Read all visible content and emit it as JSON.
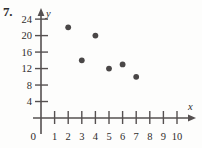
{
  "problem": {
    "number": "7."
  },
  "chart_data": {
    "type": "scatter",
    "title": "",
    "xlabel": "x",
    "ylabel": "y",
    "origin_label": "0",
    "xlim": [
      0,
      10.6
    ],
    "ylim": [
      0,
      26
    ],
    "grid": false,
    "legend": null,
    "x_ticks": [
      1,
      2,
      3,
      4,
      5,
      6,
      7,
      8,
      9,
      10
    ],
    "x_tick_labels": [
      "1",
      "2",
      "3",
      "4",
      "5",
      "6",
      "7",
      "8",
      "9",
      "10"
    ],
    "y_ticks": [
      4,
      8,
      12,
      16,
      20,
      24
    ],
    "y_tick_labels": [
      "4",
      "8",
      "12",
      "16",
      "20",
      "24"
    ],
    "points": [
      {
        "x": 2,
        "y": 22
      },
      {
        "x": 3,
        "y": 14
      },
      {
        "x": 4,
        "y": 20
      },
      {
        "x": 5,
        "y": 12
      },
      {
        "x": 6,
        "y": 13
      },
      {
        "x": 7,
        "y": 10
      }
    ],
    "colors": {
      "ink": "#555050",
      "point": "#4a4747",
      "text": "#2f2c2c",
      "background": "#fdfdfc"
    }
  }
}
